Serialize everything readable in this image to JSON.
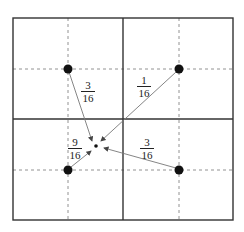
{
  "diagram": {
    "type": "bilinear-interpolation-weights",
    "colors": {
      "frame": "#333333",
      "dashed": "#666666",
      "arrow": "#777777",
      "dot": "#111111"
    },
    "frame": {
      "x": 13,
      "y": 18,
      "w": 220,
      "h": 202
    },
    "center_lines": {
      "x": 123,
      "y": 119
    },
    "dashed_lines": {
      "x": [
        68,
        179
      ],
      "y": [
        69,
        170
      ]
    },
    "sample_points": [
      {
        "id": "top-left",
        "x": 68,
        "y": 69
      },
      {
        "id": "top-right",
        "x": 179,
        "y": 69
      },
      {
        "id": "bottom-left",
        "x": 68,
        "y": 170
      },
      {
        "id": "bottom-right",
        "x": 179,
        "y": 170
      }
    ],
    "target_point": {
      "x": 96,
      "y": 146
    },
    "weights": [
      {
        "from": "top-left",
        "num": "3",
        "den": "16",
        "label_x": 80,
        "label_y": 80
      },
      {
        "from": "top-right",
        "num": "1",
        "den": "16",
        "label_x": 136,
        "label_y": 75
      },
      {
        "from": "bottom-left",
        "num": "9",
        "den": "16",
        "label_x": 67,
        "label_y": 138
      },
      {
        "from": "bottom-right",
        "num": "3",
        "den": "16",
        "label_x": 138,
        "label_y": 138
      }
    ]
  }
}
